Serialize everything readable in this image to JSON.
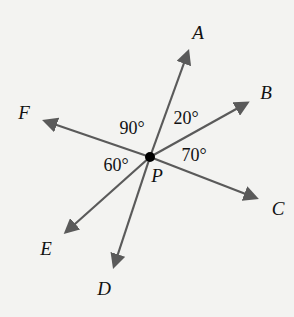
{
  "diagram": {
    "center": {
      "name": "P",
      "x": 150,
      "y": 157
    },
    "ray_color": "#5a5a5a",
    "rays": [
      {
        "name": "A",
        "end": [
          188,
          52
        ],
        "label_pos": [
          198,
          32
        ]
      },
      {
        "name": "B",
        "end": [
          247,
          103
        ],
        "label_pos": [
          266,
          92
        ]
      },
      {
        "name": "C",
        "end": [
          256,
          198
        ],
        "label_pos": [
          278,
          208
        ]
      },
      {
        "name": "D",
        "end": [
          114,
          266
        ],
        "label_pos": [
          104,
          288
        ]
      },
      {
        "name": "E",
        "end": [
          66,
          232
        ],
        "label_pos": [
          46,
          248
        ]
      },
      {
        "name": "F",
        "end": [
          45,
          121
        ],
        "label_pos": [
          24,
          112
        ]
      }
    ],
    "angles": [
      {
        "label": "90°",
        "between": [
          "F",
          "A"
        ],
        "pos": [
          132,
          128
        ]
      },
      {
        "label": "20°",
        "between": [
          "A",
          "B"
        ],
        "pos": [
          186,
          118
        ]
      },
      {
        "label": "70°",
        "between": [
          "B",
          "C"
        ],
        "pos": [
          194,
          155
        ]
      },
      {
        "label": "60°",
        "between": [
          "E",
          "F"
        ],
        "pos": [
          116,
          165
        ]
      }
    ]
  }
}
